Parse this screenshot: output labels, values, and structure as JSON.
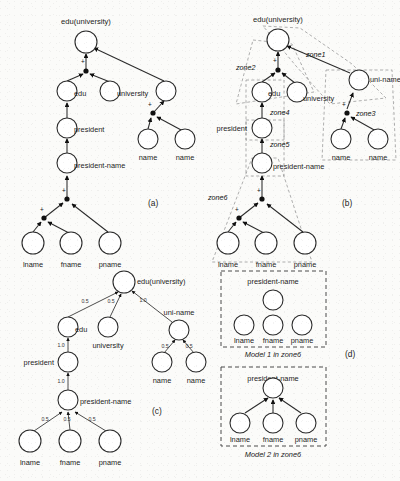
{
  "figure": {
    "background_color": "#fbfbf9",
    "ink_color": "#1c1c1c",
    "zone_color": "#9a9a9a"
  },
  "panels": [
    {
      "id": "a",
      "label": "(a)"
    },
    {
      "id": "b",
      "label": "(b)"
    },
    {
      "id": "c",
      "label": "(c)"
    },
    {
      "id": "d",
      "label": "(d)"
    }
  ],
  "panel_a": {
    "label": "(a)",
    "nodes": [
      {
        "id": "a-root",
        "label": "edu(university)",
        "cx": 86,
        "cy": 42,
        "r": 11,
        "label_pos": "above"
      },
      {
        "id": "a-edu",
        "label": "edu",
        "cx": 67,
        "cy": 91,
        "r": 10,
        "label_pos": "right"
      },
      {
        "id": "a-univ",
        "label": "university",
        "cx": 110,
        "cy": 91,
        "r": 10,
        "label_pos": "right"
      },
      {
        "id": "a-uniname",
        "label": "",
        "cx": 166,
        "cy": 91,
        "r": 10,
        "label_pos": "none"
      },
      {
        "id": "a-pres",
        "label": "president",
        "cx": 67,
        "cy": 128,
        "r": 10,
        "label_pos": "right"
      },
      {
        "id": "a-presname",
        "label": "president-name",
        "cx": 67,
        "cy": 163,
        "r": 10,
        "label_pos": "right"
      },
      {
        "id": "a-name1",
        "label": "name",
        "cx": 148,
        "cy": 139,
        "r": 10,
        "label_pos": "below"
      },
      {
        "id": "a-name2",
        "label": "name",
        "cx": 185,
        "cy": 139,
        "r": 10,
        "label_pos": "below"
      },
      {
        "id": "a-lname",
        "label": "lname",
        "cx": 33,
        "cy": 243,
        "r": 11,
        "label_pos": "below"
      },
      {
        "id": "a-fname",
        "label": "fname",
        "cx": 71,
        "cy": 243,
        "r": 11,
        "label_pos": "below"
      },
      {
        "id": "a-pname",
        "label": "pname",
        "cx": 110,
        "cy": 243,
        "r": 11,
        "label_pos": "below"
      }
    ],
    "joints": [
      {
        "id": "a-j1",
        "cx": 86,
        "cy": 71,
        "plus": "+"
      },
      {
        "id": "a-j2",
        "cx": 153,
        "cy": 113,
        "plus": "+"
      },
      {
        "id": "a-j3",
        "cx": 67,
        "cy": 199,
        "plus": "+"
      },
      {
        "id": "a-j4",
        "cx": 44,
        "cy": 218,
        "plus": "+"
      }
    ]
  },
  "panel_b": {
    "label": "(b)",
    "zones": [
      {
        "id": "zone1",
        "label": "zone1"
      },
      {
        "id": "zone2",
        "label": "zone2"
      },
      {
        "id": "zone3",
        "label": "zone3"
      },
      {
        "id": "zone4",
        "label": "zone4"
      },
      {
        "id": "zone5",
        "label": "zone5"
      },
      {
        "id": "zone6",
        "label": "zone6"
      }
    ],
    "nodes": [
      {
        "id": "b-root",
        "label": "edu(university)",
        "cx": 278,
        "cy": 40,
        "r": 11,
        "label_pos": "above"
      },
      {
        "id": "b-edu",
        "label": "edu",
        "cx": 262,
        "cy": 92,
        "r": 10,
        "label_pos": "right"
      },
      {
        "id": "b-univ",
        "label": "university",
        "cx": 297,
        "cy": 92,
        "r": 10,
        "label_pos": "right"
      },
      {
        "id": "b-uniname",
        "label": "uni-name",
        "cx": 359,
        "cy": 80,
        "r": 10,
        "label_pos": "right"
      },
      {
        "id": "b-pres",
        "label": "president",
        "cx": 262,
        "cy": 128,
        "r": 10,
        "label_pos": "left"
      },
      {
        "id": "b-presname",
        "label": "president-name",
        "cx": 262,
        "cy": 163,
        "r": 10,
        "label_pos": "right"
      },
      {
        "id": "b-name1",
        "label": "name",
        "cx": 341,
        "cy": 139,
        "r": 10,
        "label_pos": "below"
      },
      {
        "id": "b-name2",
        "label": "name",
        "cx": 378,
        "cy": 139,
        "r": 10,
        "label_pos": "below"
      },
      {
        "id": "b-lname",
        "label": "lname",
        "cx": 228,
        "cy": 243,
        "r": 11,
        "label_pos": "below"
      },
      {
        "id": "b-fname",
        "label": "fname",
        "cx": 266,
        "cy": 243,
        "r": 11,
        "label_pos": "below"
      },
      {
        "id": "b-pname",
        "label": "pname",
        "cx": 305,
        "cy": 243,
        "r": 11,
        "label_pos": "below"
      }
    ],
    "joints": [
      {
        "id": "b-j1",
        "cx": 278,
        "cy": 70,
        "plus": "+"
      },
      {
        "id": "b-j2",
        "cx": 347,
        "cy": 113,
        "plus": "+"
      },
      {
        "id": "b-j3",
        "cx": 262,
        "cy": 199,
        "plus": "+"
      },
      {
        "id": "b-j4",
        "cx": 239,
        "cy": 218,
        "plus": "+"
      }
    ]
  },
  "panel_c": {
    "label": "(c)",
    "nodes": [
      {
        "id": "c-root",
        "label": "edu(university)",
        "cx": 124,
        "cy": 282,
        "r": 11,
        "label_pos": "right"
      },
      {
        "id": "c-edu",
        "label": "edu",
        "cx": 68,
        "cy": 327,
        "r": 10,
        "label_pos": "right"
      },
      {
        "id": "c-univ",
        "label": "university",
        "cx": 108,
        "cy": 327,
        "r": 10,
        "label_pos": "below"
      },
      {
        "id": "c-uniname",
        "label": "uni-name",
        "cx": 179,
        "cy": 330,
        "r": 10,
        "label_pos": "above"
      },
      {
        "id": "c-pres",
        "label": "president",
        "cx": 68,
        "cy": 362,
        "r": 10,
        "label_pos": "left"
      },
      {
        "id": "c-presname",
        "label": "president-name",
        "cx": 68,
        "cy": 400,
        "r": 10,
        "label_pos": "right"
      },
      {
        "id": "c-name1",
        "label": "name",
        "cx": 162,
        "cy": 362,
        "r": 10,
        "label_pos": "below"
      },
      {
        "id": "c-name2",
        "label": "name",
        "cx": 196,
        "cy": 362,
        "r": 10,
        "label_pos": "below"
      },
      {
        "id": "c-lname",
        "label": "lname",
        "cx": 30,
        "cy": 441,
        "r": 11,
        "label_pos": "below"
      },
      {
        "id": "c-fname",
        "label": "fname",
        "cx": 70,
        "cy": 441,
        "r": 11,
        "label_pos": "below"
      },
      {
        "id": "c-pname",
        "label": "pname",
        "cx": 110,
        "cy": 441,
        "r": 11,
        "label_pos": "below"
      }
    ],
    "weights": [
      {
        "id": "c-w1",
        "value": "0.5",
        "x": 85,
        "y": 303
      },
      {
        "id": "c-w2",
        "value": "0.5",
        "x": 111,
        "y": 303
      },
      {
        "id": "c-w3",
        "value": "1.0",
        "x": 143,
        "y": 302
      },
      {
        "id": "c-w4",
        "value": "1.0",
        "x": 61,
        "y": 347
      },
      {
        "id": "c-w5",
        "value": "1.0",
        "x": 61,
        "y": 383
      },
      {
        "id": "c-w6",
        "value": "0.5",
        "x": 165,
        "y": 348
      },
      {
        "id": "c-w7",
        "value": "0.5",
        "x": 189,
        "y": 348
      },
      {
        "id": "c-w8",
        "value": "0.5",
        "x": 45,
        "y": 421
      },
      {
        "id": "c-w9",
        "value": "0.5",
        "x": 67,
        "y": 421
      },
      {
        "id": "c-w10",
        "value": "0.5",
        "x": 92,
        "y": 421
      }
    ]
  },
  "panel_d": {
    "label": "(d)",
    "models": [
      {
        "id": "model1",
        "caption": "Model 1 in zone6",
        "title": "president-name",
        "leaves": [
          "lname",
          "fname",
          "pname"
        ],
        "has_edges": false
      },
      {
        "id": "model2",
        "caption": "Model 2 in zone6",
        "title": "president-name",
        "leaves": [
          "lname",
          "fname",
          "pname"
        ],
        "has_edges": true
      }
    ]
  }
}
